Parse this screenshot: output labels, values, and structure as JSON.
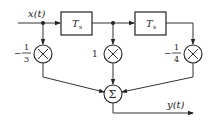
{
  "diagram": {
    "type": "block-diagram",
    "input_label": "x(t)",
    "output_label": "y(t)",
    "delay_blocks": [
      {
        "label": "T",
        "subscript": "s"
      },
      {
        "label": "T",
        "subscript": "s"
      }
    ],
    "multipliers": [
      {
        "symbol": "×",
        "coefficient_sign": "−",
        "coefficient_num": "1",
        "coefficient_den": "3"
      },
      {
        "symbol": "×",
        "coefficient": "1"
      },
      {
        "symbol": "×",
        "coefficient_sign": "−",
        "coefficient_num": "1",
        "coefficient_den": "4"
      }
    ],
    "summer": {
      "symbol": "Σ"
    }
  }
}
